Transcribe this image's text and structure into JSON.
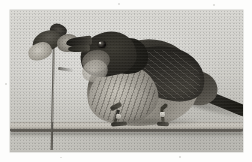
{
  "page": {
    "kind": "photograph",
    "medium": "black-and-white halftone print",
    "width": 252,
    "height": 162,
    "margin_color": "#fdfdfc"
  },
  "photo": {
    "frame": {
      "left": 10,
      "top": 10,
      "width": 233,
      "height": 142
    },
    "background_color": "#d4d3ce",
    "tone": "grayscale",
    "grain": "heavy film grain"
  },
  "subject": {
    "name": "perched bird",
    "description": "A shrike-like passerine bird standing on a horizontal wooden dowel, reaching forward to feed on prey impaled on a vertical wire.",
    "parts": {
      "head": "dark hood",
      "eye": "black round eye with small highlight",
      "beak": "short hooked dark bill gripping prey",
      "breast": "pale grey breast with fine dark scaly barring",
      "wing": "dark folded wing with pale feather edges",
      "tail": "long dark tail angled down to the right",
      "legs": "two dark legs gripping the perch",
      "band": "pale numbered leg band on each tarsus"
    }
  },
  "props": {
    "perch": {
      "label": "horizontal wooden dowel",
      "color": "#b5b1a8"
    },
    "wire": {
      "label": "vertical impaling wire",
      "color": "#55524b"
    },
    "prey": {
      "label": "impaled prey item",
      "color": "#3b3934"
    }
  },
  "artifacts": {
    "specks": "scattered scanner dust in the white border",
    "scanlines": "faint horizontal halftone lines"
  }
}
